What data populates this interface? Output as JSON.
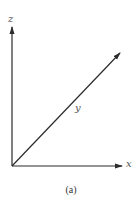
{
  "figure": {
    "caption": "(a)",
    "axes": {
      "z": {
        "label": "z",
        "direction": "up"
      },
      "y": {
        "label": "y",
        "direction": "diagonal-up-right"
      },
      "x": {
        "label": "x",
        "direction": "right"
      }
    },
    "colors": {
      "line": "#2b2b2b",
      "label": "#555555",
      "background": "#ffffff"
    }
  }
}
